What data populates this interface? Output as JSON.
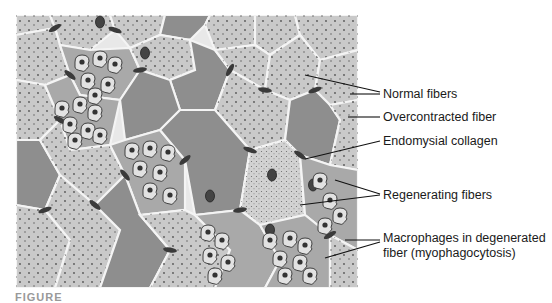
{
  "figure": {
    "type": "histology-illustration",
    "caption_fragment": "FIGURE",
    "labels": [
      {
        "id": "normal",
        "text": "Normal fibers"
      },
      {
        "id": "overcontracted",
        "text": "Overcontracted fiber"
      },
      {
        "id": "endomysial",
        "text": "Endomysial collagen"
      },
      {
        "id": "regenerating",
        "text": "Regenerating fibers"
      },
      {
        "id": "macrophages_line1",
        "text": "Macrophages in degenerated"
      },
      {
        "id": "macrophages_line2",
        "text": "fiber (myophagocytosis)"
      }
    ],
    "colors": {
      "normal_fiber": "#c9c9c9",
      "overcontracted_fiber": "#8e8e8e",
      "endomysium": "#e8e8e8",
      "nucleus": "#3a3a3a",
      "macrophage_fill": "#e2e2e2",
      "degenerated_fiber": "#a9a9a9"
    }
  }
}
